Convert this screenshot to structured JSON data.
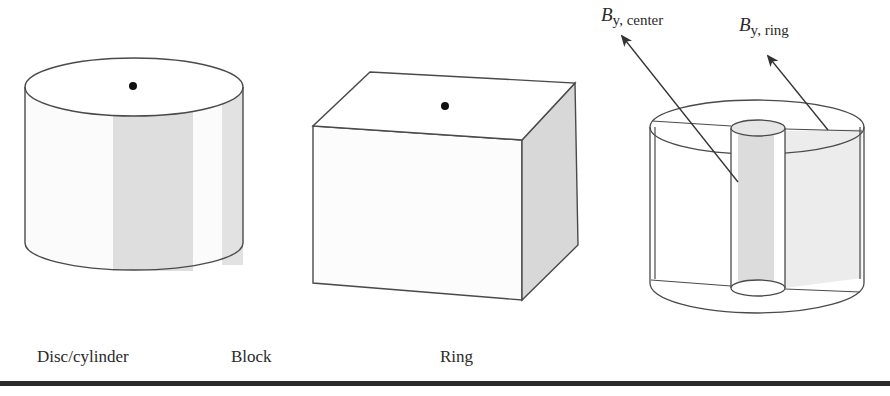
{
  "figure": {
    "shapes": [
      {
        "id": "disc",
        "label": "Disc/cylinder"
      },
      {
        "id": "block",
        "label": "Block"
      },
      {
        "id": "ring",
        "label": "Ring"
      }
    ],
    "annotations": {
      "center": {
        "symbol": "B",
        "subscript": "y, center"
      },
      "ring": {
        "symbol": "B",
        "subscript": "y, ring"
      }
    },
    "colors": {
      "stroke": "#4a4a4a",
      "shade": "#dcdcdc",
      "face": "#fbfbfb",
      "rule": "#2b2b2b"
    }
  }
}
